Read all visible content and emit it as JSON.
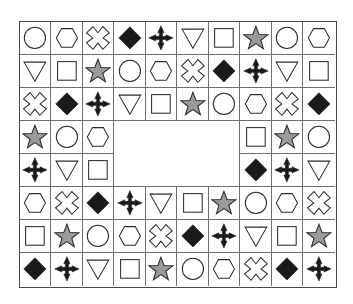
{
  "figure": {
    "grid": {
      "rows": 8,
      "cols": 10
    },
    "colors": {
      "outline": "#2b2b2b",
      "fill_black": "#1a1a1a",
      "fill_gray": "#9a9a9a",
      "fill_white": "#ffffff",
      "grid_line": "#6e6e6e",
      "frame_line": "#4a4a4a",
      "background": "#ffffff"
    },
    "shape_legend": [
      {
        "key": "circle",
        "label": "circle",
        "fill": "white"
      },
      {
        "key": "hexagon",
        "label": "hexagon",
        "fill": "white"
      },
      {
        "key": "x-cross",
        "label": "x-cross",
        "fill": "white"
      },
      {
        "key": "diamond-black",
        "label": "black diamond",
        "fill": "black"
      },
      {
        "key": "plus-black",
        "label": "black plus",
        "fill": "black"
      },
      {
        "key": "triangle-down",
        "label": "down triangle",
        "fill": "white"
      },
      {
        "key": "square",
        "label": "square",
        "fill": "white"
      },
      {
        "key": "star-gray",
        "label": "gray star",
        "fill": "gray"
      }
    ],
    "blank_region": {
      "row_start": 4,
      "row_end": 5,
      "col_start": 4,
      "col_end": 7
    },
    "cells": [
      [
        "circle",
        "hexagon",
        "x-cross",
        "diamond-black",
        "plus-black",
        "triangle-down",
        "square",
        "star-gray",
        "circle",
        "hexagon"
      ],
      [
        "triangle-down",
        "square",
        "star-gray",
        "circle",
        "hexagon",
        "x-cross",
        "diamond-black",
        "plus-black",
        "triangle-down",
        "square"
      ],
      [
        "x-cross",
        "diamond-black",
        "plus-black",
        "triangle-down",
        "square",
        "star-gray",
        "circle",
        "hexagon",
        "x-cross",
        "diamond-black"
      ],
      [
        "star-gray",
        "circle",
        "hexagon",
        "blank",
        "blank",
        "blank",
        "blank",
        "square",
        "star-gray",
        "circle"
      ],
      [
        "plus-black",
        "triangle-down",
        "square",
        "blank",
        "blank",
        "blank",
        "blank",
        "diamond-black",
        "plus-black",
        "triangle-down"
      ],
      [
        "hexagon",
        "x-cross",
        "diamond-black",
        "plus-black",
        "triangle-down",
        "square",
        "star-gray",
        "circle",
        "hexagon",
        "x-cross"
      ],
      [
        "square",
        "star-gray",
        "circle",
        "hexagon",
        "x-cross",
        "diamond-black",
        "plus-black",
        "triangle-down",
        "square",
        "star-gray"
      ],
      [
        "diamond-black",
        "plus-black",
        "triangle-down",
        "square",
        "star-gray",
        "circle",
        "hexagon",
        "x-cross",
        "diamond-black",
        "plus-black"
      ]
    ]
  }
}
